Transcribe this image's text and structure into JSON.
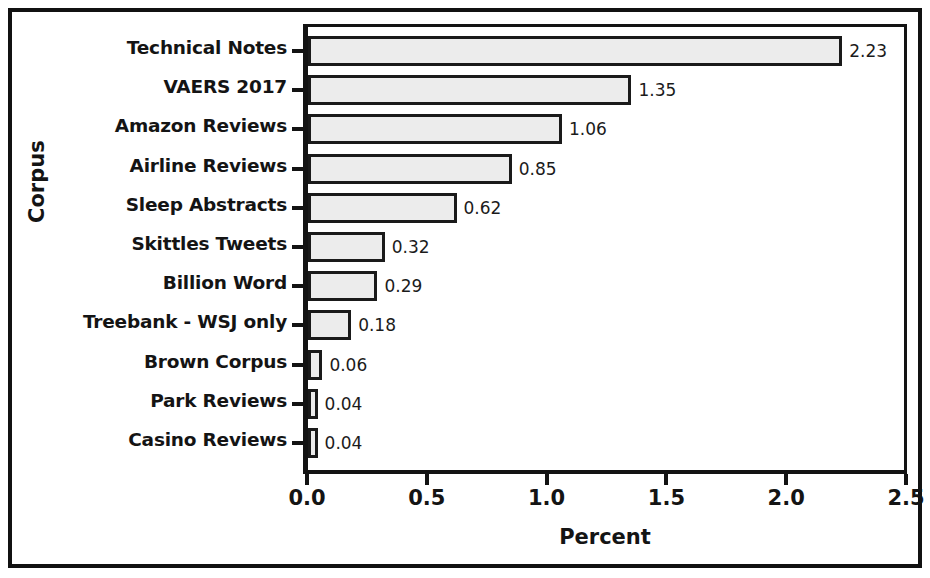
{
  "chart_data": {
    "type": "bar",
    "orientation": "horizontal",
    "title": "",
    "xlabel": "Percent",
    "ylabel": "Corpus",
    "xlim": [
      0,
      2.5
    ],
    "xticks": [
      "0.0",
      "0.5",
      "1.0",
      "1.5",
      "2.0",
      "2.5"
    ],
    "xtick_values": [
      0.0,
      0.5,
      1.0,
      1.5,
      2.0,
      2.5
    ],
    "grid": false,
    "legend": false,
    "categories": [
      "Technical Notes",
      "VAERS 2017",
      "Amazon Reviews",
      "Airline Reviews",
      "Sleep Abstracts",
      "Skittles Tweets",
      "Billion Word",
      "Treebank - WSJ only",
      "Brown Corpus",
      "Park Reviews",
      "Casino Reviews"
    ],
    "values": [
      2.23,
      1.35,
      1.06,
      0.85,
      0.62,
      0.32,
      0.29,
      0.18,
      0.06,
      0.04,
      0.04
    ],
    "value_labels": [
      "2.23",
      "1.35",
      "1.06",
      "0.85",
      "0.62",
      "0.32",
      "0.29",
      "0.18",
      "0.06",
      "0.04",
      "0.04"
    ],
    "colors": {
      "bar_fill": "#ececec",
      "bar_edge": "#1a1a1a",
      "axis": "#131313",
      "text": "#141414",
      "background": "#ffffff"
    }
  }
}
